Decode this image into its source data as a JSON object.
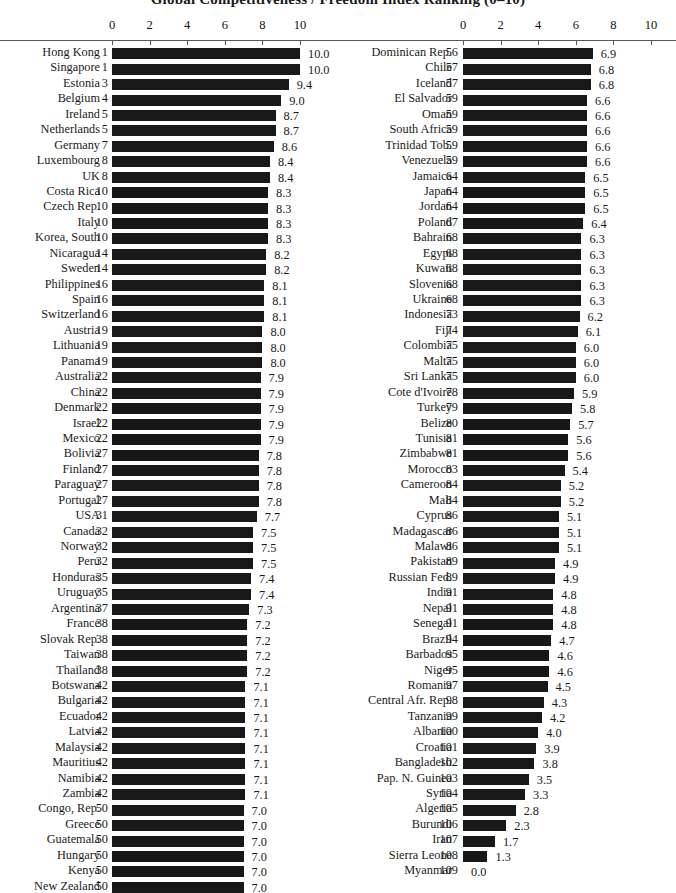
{
  "chart_data": {
    "type": "bar",
    "title": "Global Competitiveness / Freedom Index Ranking (0–10)",
    "orientation": "horizontal",
    "xlabel": "",
    "ylabel": "",
    "xlim": [
      0,
      10
    ],
    "grid": false,
    "legend": null,
    "axis": {
      "ticks": [
        0,
        2,
        4,
        6,
        8,
        10
      ],
      "tick_labels": [
        "0",
        "2",
        "4",
        "6",
        "8",
        "10"
      ],
      "position": "top"
    },
    "columns": {
      "name_header": "",
      "rank_header": "",
      "value_header": ""
    },
    "left_column": [
      {
        "name": "Hong Kong",
        "rank": "1",
        "value": 10.0,
        "label": "10.0"
      },
      {
        "name": "Singapore",
        "rank": "1",
        "value": 10.0,
        "label": "10.0"
      },
      {
        "name": "Estonia",
        "rank": "3",
        "value": 9.4,
        "label": "9.4"
      },
      {
        "name": "Belgium",
        "rank": "4",
        "value": 9.0,
        "label": "9.0"
      },
      {
        "name": "Ireland",
        "rank": "5",
        "value": 8.7,
        "label": "8.7"
      },
      {
        "name": "Netherlands",
        "rank": "5",
        "value": 8.7,
        "label": "8.7"
      },
      {
        "name": "Germany",
        "rank": "7",
        "value": 8.6,
        "label": "8.6"
      },
      {
        "name": "Luxembourg",
        "rank": "8",
        "value": 8.4,
        "label": "8.4"
      },
      {
        "name": "UK",
        "rank": "8",
        "value": 8.4,
        "label": "8.4"
      },
      {
        "name": "Costa Rica",
        "rank": "10",
        "value": 8.3,
        "label": "8.3"
      },
      {
        "name": "Czech Rep.",
        "rank": "10",
        "value": 8.3,
        "label": "8.3"
      },
      {
        "name": "Italy",
        "rank": "10",
        "value": 8.3,
        "label": "8.3"
      },
      {
        "name": "Korea, South",
        "rank": "10",
        "value": 8.3,
        "label": "8.3"
      },
      {
        "name": "Nicaragua",
        "rank": "14",
        "value": 8.2,
        "label": "8.2"
      },
      {
        "name": "Sweden",
        "rank": "14",
        "value": 8.2,
        "label": "8.2"
      },
      {
        "name": "Philippines",
        "rank": "16",
        "value": 8.1,
        "label": "8.1"
      },
      {
        "name": "Spain",
        "rank": "16",
        "value": 8.1,
        "label": "8.1"
      },
      {
        "name": "Switzerland",
        "rank": "16",
        "value": 8.1,
        "label": "8.1"
      },
      {
        "name": "Austria",
        "rank": "19",
        "value": 8.0,
        "label": "8.0"
      },
      {
        "name": "Lithuania",
        "rank": "19",
        "value": 8.0,
        "label": "8.0"
      },
      {
        "name": "Panama",
        "rank": "19",
        "value": 8.0,
        "label": "8.0"
      },
      {
        "name": "Australia",
        "rank": "22",
        "value": 7.9,
        "label": "7.9"
      },
      {
        "name": "China",
        "rank": "22",
        "value": 7.9,
        "label": "7.9"
      },
      {
        "name": "Denmark",
        "rank": "22",
        "value": 7.9,
        "label": "7.9"
      },
      {
        "name": "Israel",
        "rank": "22",
        "value": 7.9,
        "label": "7.9"
      },
      {
        "name": "Mexico",
        "rank": "22",
        "value": 7.9,
        "label": "7.9"
      },
      {
        "name": "Bolivia",
        "rank": "27",
        "value": 7.8,
        "label": "7.8"
      },
      {
        "name": "Finland",
        "rank": "27",
        "value": 7.8,
        "label": "7.8"
      },
      {
        "name": "Paraguay",
        "rank": "27",
        "value": 7.8,
        "label": "7.8"
      },
      {
        "name": "Portugal",
        "rank": "27",
        "value": 7.8,
        "label": "7.8"
      },
      {
        "name": "USA",
        "rank": "31",
        "value": 7.7,
        "label": "7.7"
      },
      {
        "name": "Canada",
        "rank": "32",
        "value": 7.5,
        "label": "7.5"
      },
      {
        "name": "Norway",
        "rank": "32",
        "value": 7.5,
        "label": "7.5"
      },
      {
        "name": "Peru",
        "rank": "32",
        "value": 7.5,
        "label": "7.5"
      },
      {
        "name": "Honduras",
        "rank": "35",
        "value": 7.4,
        "label": "7.4"
      },
      {
        "name": "Uruguay",
        "rank": "35",
        "value": 7.4,
        "label": "7.4"
      },
      {
        "name": "Argentina",
        "rank": "37",
        "value": 7.3,
        "label": "7.3"
      },
      {
        "name": "France",
        "rank": "38",
        "value": 7.2,
        "label": "7.2"
      },
      {
        "name": "Slovak Rep.",
        "rank": "38",
        "value": 7.2,
        "label": "7.2"
      },
      {
        "name": "Taiwan",
        "rank": "38",
        "value": 7.2,
        "label": "7.2"
      },
      {
        "name": "Thailand",
        "rank": "38",
        "value": 7.2,
        "label": "7.2"
      },
      {
        "name": "Botswana",
        "rank": "42",
        "value": 7.1,
        "label": "7.1"
      },
      {
        "name": "Bulgaria",
        "rank": "42",
        "value": 7.1,
        "label": "7.1"
      },
      {
        "name": "Ecuador",
        "rank": "42",
        "value": 7.1,
        "label": "7.1"
      },
      {
        "name": "Latvia",
        "rank": "42",
        "value": 7.1,
        "label": "7.1"
      },
      {
        "name": "Malaysia",
        "rank": "42",
        "value": 7.1,
        "label": "7.1"
      },
      {
        "name": "Mauritius",
        "rank": "42",
        "value": 7.1,
        "label": "7.1"
      },
      {
        "name": "Namibia",
        "rank": "42",
        "value": 7.1,
        "label": "7.1"
      },
      {
        "name": "Zambia",
        "rank": "42",
        "value": 7.1,
        "label": "7.1"
      },
      {
        "name": "Congo, Rep.",
        "rank": "50",
        "value": 7.0,
        "label": "7.0"
      },
      {
        "name": "Greece",
        "rank": "50",
        "value": 7.0,
        "label": "7.0"
      },
      {
        "name": "Guatemala",
        "rank": "50",
        "value": 7.0,
        "label": "7.0"
      },
      {
        "name": "Hungary",
        "rank": "50",
        "value": 7.0,
        "label": "7.0"
      },
      {
        "name": "Kenya",
        "rank": "50",
        "value": 7.0,
        "label": "7.0"
      },
      {
        "name": "New Zealand",
        "rank": "50",
        "value": 7.0,
        "label": "7.0"
      }
    ],
    "right_column": [
      {
        "name": "Dominican Rep.",
        "rank": "56",
        "value": 6.9,
        "label": "6.9"
      },
      {
        "name": "Chile",
        "rank": "57",
        "value": 6.8,
        "label": "6.8"
      },
      {
        "name": "Iceland",
        "rank": "57",
        "value": 6.8,
        "label": "6.8"
      },
      {
        "name": "El Salvador",
        "rank": "59",
        "value": 6.6,
        "label": "6.6"
      },
      {
        "name": "Oman",
        "rank": "59",
        "value": 6.6,
        "label": "6.6"
      },
      {
        "name": "South Africa",
        "rank": "59",
        "value": 6.6,
        "label": "6.6"
      },
      {
        "name": "Trinidad Tob.",
        "rank": "59",
        "value": 6.6,
        "label": "6.6"
      },
      {
        "name": "Venezuela",
        "rank": "59",
        "value": 6.6,
        "label": "6.6"
      },
      {
        "name": "Jamaica",
        "rank": "64",
        "value": 6.5,
        "label": "6.5"
      },
      {
        "name": "Japan",
        "rank": "64",
        "value": 6.5,
        "label": "6.5"
      },
      {
        "name": "Jordan",
        "rank": "64",
        "value": 6.5,
        "label": "6.5"
      },
      {
        "name": "Poland",
        "rank": "67",
        "value": 6.4,
        "label": "6.4"
      },
      {
        "name": "Bahrain",
        "rank": "68",
        "value": 6.3,
        "label": "6.3"
      },
      {
        "name": "Egypt",
        "rank": "68",
        "value": 6.3,
        "label": "6.3"
      },
      {
        "name": "Kuwait",
        "rank": "68",
        "value": 6.3,
        "label": "6.3"
      },
      {
        "name": "Slovenia",
        "rank": "68",
        "value": 6.3,
        "label": "6.3"
      },
      {
        "name": "Ukraine",
        "rank": "68",
        "value": 6.3,
        "label": "6.3"
      },
      {
        "name": "Indonesia",
        "rank": "73",
        "value": 6.2,
        "label": "6.2"
      },
      {
        "name": "Fiji",
        "rank": "74",
        "value": 6.1,
        "label": "6.1"
      },
      {
        "name": "Colombia",
        "rank": "75",
        "value": 6.0,
        "label": "6.0"
      },
      {
        "name": "Malta",
        "rank": "75",
        "value": 6.0,
        "label": "6.0"
      },
      {
        "name": "Sri Lanka",
        "rank": "75",
        "value": 6.0,
        "label": "6.0"
      },
      {
        "name": "Cote d'Ivoire",
        "rank": "78",
        "value": 5.9,
        "label": "5.9"
      },
      {
        "name": "Turkey",
        "rank": "79",
        "value": 5.8,
        "label": "5.8"
      },
      {
        "name": "Belize",
        "rank": "80",
        "value": 5.7,
        "label": "5.7"
      },
      {
        "name": "Tunisia",
        "rank": "81",
        "value": 5.6,
        "label": "5.6"
      },
      {
        "name": "Zimbabwe",
        "rank": "81",
        "value": 5.6,
        "label": "5.6"
      },
      {
        "name": "Morocco",
        "rank": "83",
        "value": 5.4,
        "label": "5.4"
      },
      {
        "name": "Cameroon",
        "rank": "84",
        "value": 5.2,
        "label": "5.2"
      },
      {
        "name": "Mali",
        "rank": "84",
        "value": 5.2,
        "label": "5.2"
      },
      {
        "name": "Cyprus",
        "rank": "86",
        "value": 5.1,
        "label": "5.1"
      },
      {
        "name": "Madagascar",
        "rank": "86",
        "value": 5.1,
        "label": "5.1"
      },
      {
        "name": "Malawi",
        "rank": "86",
        "value": 5.1,
        "label": "5.1"
      },
      {
        "name": "Pakistan",
        "rank": "89",
        "value": 4.9,
        "label": "4.9"
      },
      {
        "name": "Russian Fed.",
        "rank": "89",
        "value": 4.9,
        "label": "4.9"
      },
      {
        "name": "India",
        "rank": "91",
        "value": 4.8,
        "label": "4.8"
      },
      {
        "name": "Nepal",
        "rank": "91",
        "value": 4.8,
        "label": "4.8"
      },
      {
        "name": "Senegal",
        "rank": "91",
        "value": 4.8,
        "label": "4.8"
      },
      {
        "name": "Brazil",
        "rank": "94",
        "value": 4.7,
        "label": "4.7"
      },
      {
        "name": "Barbados",
        "rank": "95",
        "value": 4.6,
        "label": "4.6"
      },
      {
        "name": "Niger",
        "rank": "95",
        "value": 4.6,
        "label": "4.6"
      },
      {
        "name": "Romania",
        "rank": "97",
        "value": 4.5,
        "label": "4.5"
      },
      {
        "name": "Central Afr. Rep.",
        "rank": "98",
        "value": 4.3,
        "label": "4.3"
      },
      {
        "name": "Tanzania",
        "rank": "99",
        "value": 4.2,
        "label": "4.2"
      },
      {
        "name": "Albania",
        "rank": "100",
        "value": 4.0,
        "label": "4.0"
      },
      {
        "name": "Croatia",
        "rank": "101",
        "value": 3.9,
        "label": "3.9"
      },
      {
        "name": "Bangladesh",
        "rank": "102",
        "value": 3.8,
        "label": "3.8"
      },
      {
        "name": "Pap. N. Guinea",
        "rank": "103",
        "value": 3.5,
        "label": "3.5"
      },
      {
        "name": "Syria",
        "rank": "104",
        "value": 3.3,
        "label": "3.3"
      },
      {
        "name": "Algeria",
        "rank": "105",
        "value": 2.8,
        "label": "2.8"
      },
      {
        "name": "Burundi",
        "rank": "106",
        "value": 2.3,
        "label": "2.3"
      },
      {
        "name": "Iran",
        "rank": "107",
        "value": 1.7,
        "label": "1.7"
      },
      {
        "name": "Sierra Leone",
        "rank": "108",
        "value": 1.3,
        "label": "1.3"
      },
      {
        "name": "Myanmar",
        "rank": "109",
        "value": 0.0,
        "label": "0.0"
      }
    ]
  }
}
